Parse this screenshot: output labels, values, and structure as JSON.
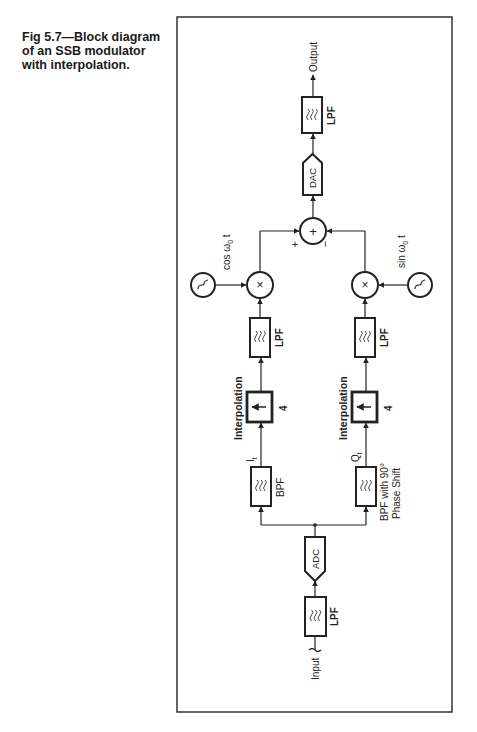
{
  "caption": {
    "line1": "Fig 5.7—Block diagram",
    "line2": "of an SSB modulator",
    "line3": "with interpolation."
  },
  "diagram": {
    "input_label": "Input",
    "output_label": "Output",
    "blocks": {
      "input_lpf": "LPF",
      "adc": "ADC",
      "bpf_i": "BPF",
      "bpf_q_line1": "BPF with 90°",
      "bpf_q_line2": "Phase Shift",
      "interp_i_label": "Interpolation",
      "interp_i_factor": "4",
      "interp_q_label": "Interpolation",
      "interp_q_factor": "4",
      "lpf_i": "LPF",
      "lpf_q": "LPF",
      "dac": "DAC",
      "output_lpf": "LPF"
    },
    "signals": {
      "i_signal": "I",
      "i_sub": "t",
      "q_signal": "Q",
      "q_sub": "t",
      "cos_osc": "cos ω",
      "cos_sub": "0",
      "cos_t": " t",
      "sin_osc": "sin ω",
      "sin_sub": "0",
      "sin_t": " t"
    },
    "summer": {
      "plus_sign": "+",
      "minus_sign": "−",
      "symbol": "+"
    },
    "mixer_symbol": "×"
  }
}
